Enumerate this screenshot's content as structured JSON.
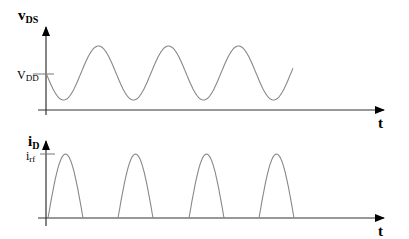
{
  "top_plot": {
    "y_label_main": "v",
    "y_label_sub": "DS",
    "x_label": "t",
    "level_label_main": "V",
    "level_label_sub": "DD",
    "waveform": "sinusoid",
    "cycles_shown": 3.5
  },
  "bottom_plot": {
    "y_label_main": "i",
    "y_label_sub": "D",
    "x_label": "t",
    "level_label_main": "i",
    "level_label_sub": "rf",
    "waveform": "half-wave rectified pulses",
    "pulses_shown": 4
  },
  "colors": {
    "axis": "#000000",
    "curve": "#888888"
  }
}
